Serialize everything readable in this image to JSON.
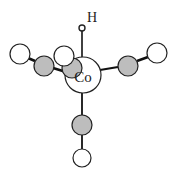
{
  "diagram": {
    "colors": {
      "bond": "#111111",
      "outline": "#222222",
      "carbon_fill": "#bdbdbd",
      "oxygen_fill": "#ffffff",
      "metal_fill": "#ffffff",
      "hydrogen_fill": "#ffffff"
    },
    "atoms": {
      "metal": {
        "label": "Co",
        "x": 83,
        "y": 75,
        "r": 18
      },
      "hydrogen": {
        "label": "H",
        "x": 82,
        "y": 28,
        "r": 3,
        "label_x": 86,
        "label_y": 22
      }
    },
    "ligands": [
      {
        "name": "CO-left-front",
        "c": {
          "x": 44,
          "y": 66,
          "r": 10
        },
        "o": {
          "x": 20,
          "y": 54,
          "r": 10
        }
      },
      {
        "name": "CO-left-back",
        "c": {
          "x": 72,
          "y": 68,
          "r": 10
        },
        "o": {
          "x": 64,
          "y": 56,
          "r": 10
        }
      },
      {
        "name": "CO-right",
        "c": {
          "x": 128,
          "y": 66,
          "r": 10
        },
        "o": {
          "x": 157,
          "y": 53,
          "r": 10
        }
      },
      {
        "name": "CO-bottom",
        "c": {
          "x": 82,
          "y": 125,
          "r": 10
        },
        "o": {
          "x": 82,
          "y": 158,
          "r": 9
        }
      }
    ]
  }
}
